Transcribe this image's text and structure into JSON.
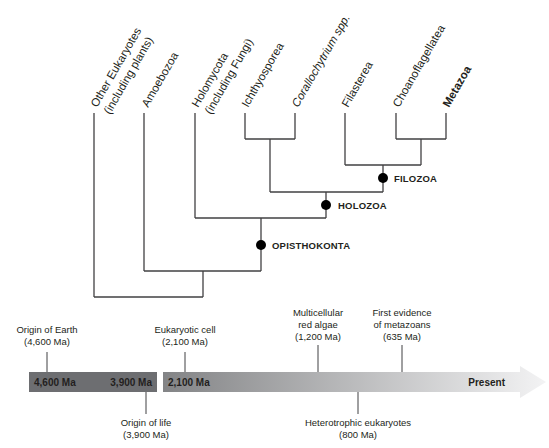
{
  "tree": {
    "leaves": [
      {
        "label_line1": "Other Eukaryotes",
        "label_line2": "(including plants)",
        "bold": false
      },
      {
        "label_line1": "Amoebozoa",
        "label_line2": "",
        "bold": false
      },
      {
        "label_line1": "Holomycota",
        "label_line2": "(including Fungi)",
        "bold": false
      },
      {
        "label_line1": "Ichthyosporea",
        "label_line2": "",
        "bold": false
      },
      {
        "label_line1": "Corallochytrium spp.",
        "label_line2": "",
        "bold": false
      },
      {
        "label_line1": "Filasterea",
        "label_line2": "",
        "bold": false
      },
      {
        "label_line1": "Choanoflagellatea",
        "label_line2": "",
        "bold": false
      },
      {
        "label_line1": "Metazoa",
        "label_line2": "",
        "bold": true
      }
    ],
    "clades": [
      {
        "name": "FILOZOA"
      },
      {
        "name": "HOLOZOA"
      },
      {
        "name": "OPISTHOKONTA"
      }
    ]
  },
  "timeline": {
    "bar_labels": {
      "start": "4,600 Ma",
      "life": "3,900 Ma",
      "eukaryote": "2,100 Ma",
      "present": "Present"
    },
    "events_above": [
      {
        "line1": "Origin of Earth",
        "line2": "(4,600 Ma)",
        "line3": ""
      },
      {
        "line1": "Eukaryotic cell",
        "line2": "(2,100 Ma)",
        "line3": ""
      },
      {
        "line1": "Multicellular",
        "line2": "red algae",
        "line3": "(1,200 Ma)"
      },
      {
        "line1": "First evidence",
        "line2": "of metazoans",
        "line3": "(635 Ma)"
      }
    ],
    "events_below": [
      {
        "line1": "Origin of life",
        "line2": "(3,900 Ma)"
      },
      {
        "line1": "Heterotrophic eukaryotes",
        "line2": "(800 Ma)"
      }
    ],
    "colors": {
      "dark_bar": "#6d6e71",
      "gradient_start": "#808285",
      "gradient_end": "#f1f1f2"
    }
  }
}
